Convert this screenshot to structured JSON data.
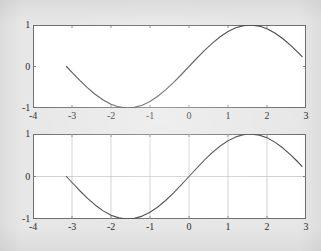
{
  "figure": {
    "background_color": "#e7e7e7",
    "axes_color": "#6f6f6f",
    "grid_color": "#bdbdbd",
    "curve_color": "#4a4a4a",
    "label_color": "#2b2b2b"
  },
  "chart_data": [
    {
      "type": "line",
      "name": "top-subplot",
      "title": "",
      "xlabel": "",
      "ylabel": "",
      "xlim": [
        -4,
        3
      ],
      "ylim": [
        -1,
        1
      ],
      "xticks": [
        -4,
        -3,
        -2,
        -1,
        0,
        1,
        2,
        3
      ],
      "xticklabels": [
        "-4",
        "-3",
        "-2",
        "-1",
        "0",
        "1",
        "2",
        "3"
      ],
      "yticks": [
        -1,
        0,
        1
      ],
      "yticklabels": [
        "-1",
        "0",
        "1"
      ],
      "grid": false,
      "legend": null,
      "series": [
        {
          "name": "sin(x)",
          "expression": "sin(x)",
          "x": [
            -3.1416,
            -3.0,
            -2.8,
            -2.6,
            -2.4,
            -2.2,
            -2.0,
            -1.8,
            -1.6,
            -1.4,
            -1.2,
            -1.0,
            -0.8,
            -0.6,
            -0.4,
            -0.2,
            0.0,
            0.2,
            0.4,
            0.6,
            0.8,
            1.0,
            1.2,
            1.4,
            1.5708,
            1.8,
            2.0,
            2.2,
            2.4,
            2.6,
            2.8,
            2.9
          ],
          "y": [
            0.0,
            -0.1411,
            -0.335,
            -0.5155,
            -0.6755,
            -0.8085,
            -0.9093,
            -0.9738,
            -0.9996,
            -0.9854,
            -0.932,
            -0.8415,
            -0.7174,
            -0.5646,
            -0.3894,
            -0.1987,
            0.0,
            0.1987,
            0.3894,
            0.5646,
            0.7174,
            0.8415,
            0.932,
            0.9854,
            1.0,
            0.9738,
            0.9093,
            0.8085,
            0.6755,
            0.5155,
            0.335,
            0.2392
          ]
        }
      ]
    },
    {
      "type": "line",
      "name": "bottom-subplot",
      "title": "",
      "xlabel": "",
      "ylabel": "",
      "xlim": [
        -4,
        3
      ],
      "ylim": [
        -1,
        1
      ],
      "xticks": [
        -4,
        -3,
        -2,
        -1,
        0,
        1,
        2,
        3
      ],
      "xticklabels": [
        "-4",
        "-3",
        "-2",
        "-1",
        "0",
        "1",
        "2",
        "3"
      ],
      "yticks": [
        -1,
        0,
        1
      ],
      "yticklabels": [
        "-1",
        "0",
        "1"
      ],
      "grid": true,
      "gridlines": {
        "vertical_at": [
          -3,
          -2,
          -1,
          0,
          1,
          2
        ],
        "horizontal_at": [
          0
        ]
      },
      "legend": null,
      "series": [
        {
          "name": "sin(x)",
          "expression": "sin(x)",
          "x": [
            -3.1416,
            -3.0,
            -2.8,
            -2.6,
            -2.4,
            -2.2,
            -2.0,
            -1.8,
            -1.6,
            -1.4,
            -1.2,
            -1.0,
            -0.8,
            -0.6,
            -0.4,
            -0.2,
            0.0,
            0.2,
            0.4,
            0.6,
            0.8,
            1.0,
            1.2,
            1.4,
            1.5708,
            1.8,
            2.0,
            2.2,
            2.4,
            2.6,
            2.8,
            2.9
          ],
          "y": [
            0.0,
            -0.1411,
            -0.335,
            -0.5155,
            -0.6755,
            -0.8085,
            -0.9093,
            -0.9738,
            -0.9996,
            -0.9854,
            -0.932,
            -0.8415,
            -0.7174,
            -0.5646,
            -0.3894,
            -0.1987,
            0.0,
            0.1987,
            0.3894,
            0.5646,
            0.7174,
            0.8415,
            0.932,
            0.9854,
            1.0,
            0.9738,
            0.9093,
            0.8085,
            0.6755,
            0.5155,
            0.335,
            0.2392
          ]
        }
      ]
    }
  ]
}
